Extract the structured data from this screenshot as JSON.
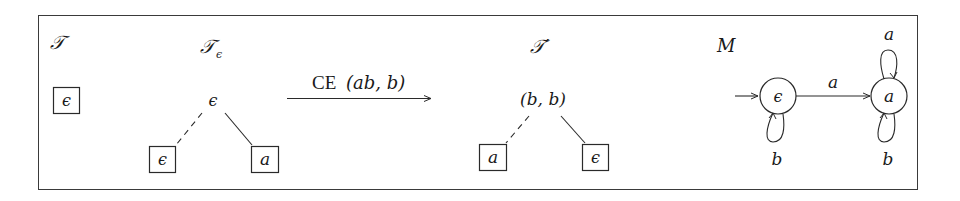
{
  "figure": {
    "panels": [
      {
        "id": "T",
        "title": "𝒯",
        "leaves": [
          {
            "label": "ϵ"
          }
        ]
      },
      {
        "id": "T_eps",
        "title": "𝒯",
        "title_subscript": "ϵ",
        "root": {
          "label": "ϵ"
        },
        "children": [
          {
            "label": "ϵ",
            "edge": "dashed"
          },
          {
            "label": "a",
            "edge": "solid"
          }
        ]
      },
      {
        "id": "transition",
        "label_roman": "CE",
        "label_args": "(ab, b)"
      },
      {
        "id": "T_prime",
        "title": "𝒯′",
        "root": {
          "label": "(b, b)"
        },
        "children": [
          {
            "label": "a",
            "edge": "dashed"
          },
          {
            "label": "ϵ",
            "edge": "solid"
          }
        ]
      },
      {
        "id": "M",
        "title": "M",
        "states": [
          {
            "label": "ϵ",
            "initial": true
          },
          {
            "label": "a",
            "initial": false
          }
        ],
        "transitions": [
          {
            "from": "ϵ",
            "to": "a",
            "symbol": "a"
          },
          {
            "from": "ϵ",
            "to": "ϵ",
            "symbol": "b"
          },
          {
            "from": "a",
            "to": "a",
            "symbol": "a"
          },
          {
            "from": "a",
            "to": "a",
            "symbol": "b"
          }
        ]
      }
    ]
  }
}
